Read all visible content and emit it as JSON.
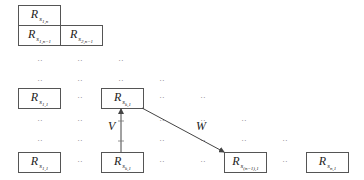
{
  "cells": [
    {
      "id": "s1n",
      "base": "R",
      "sub": "s",
      "sub2": "1,n",
      "x": 18,
      "y": 5
    },
    {
      "id": "s1n1",
      "base": "R",
      "sub": "s",
      "sub2": "1,n−1",
      "x": 18,
      "y": 25
    },
    {
      "id": "s2n1",
      "base": "R",
      "sub": "s",
      "sub2": "2,n−1",
      "x": 60,
      "y": 25
    },
    {
      "id": "s11mid",
      "base": "R",
      "sub": "s",
      "sub2": "1,1",
      "x": 18,
      "y": 88
    },
    {
      "id": "sk1mid",
      "base": "R",
      "sub": "s",
      "sub2": "k,1",
      "x": 101,
      "y": 88
    },
    {
      "id": "s11",
      "base": "R",
      "sub": "s",
      "sub2": "1,1",
      "x": 18,
      "y": 152
    },
    {
      "id": "sk1",
      "base": "R",
      "sub": "s",
      "sub2": "k,1",
      "x": 101,
      "y": 152
    },
    {
      "id": "sn11",
      "base": "R",
      "sub": "s",
      "sub2": "(n−1),1",
      "x": 224,
      "y": 152
    },
    {
      "id": "sn1",
      "base": "R",
      "sub": "s",
      "sub2": "n,1",
      "x": 306,
      "y": 152
    }
  ],
  "dots_glyph": "··",
  "dots": [
    [
      40,
      61
    ],
    [
      80,
      61
    ],
    [
      121,
      61
    ],
    [
      40,
      81
    ],
    [
      80,
      81
    ],
    [
      121,
      81
    ],
    [
      162,
      81
    ],
    [
      80,
      98
    ],
    [
      162,
      98
    ],
    [
      203,
      98
    ],
    [
      40,
      121
    ],
    [
      80,
      121
    ],
    [
      162,
      121
    ],
    [
      203,
      121
    ],
    [
      244,
      121
    ],
    [
      40,
      141
    ],
    [
      80,
      141
    ],
    [
      162,
      141
    ],
    [
      203,
      141
    ],
    [
      244,
      141
    ],
    [
      285,
      141
    ],
    [
      80,
      162
    ],
    [
      162,
      162
    ],
    [
      203,
      162
    ],
    [
      285,
      162
    ]
  ],
  "arrows": {
    "V": {
      "label": "V",
      "from": [
        121,
        152
      ],
      "to": [
        121,
        109
      ]
    },
    "W": {
      "label": "W",
      "from": [
        142,
        108
      ],
      "to": [
        224,
        152
      ]
    }
  }
}
